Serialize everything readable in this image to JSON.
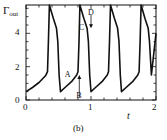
{
  "chart_data": {
    "type": "line",
    "title": "",
    "panel_label": "(b)",
    "xlabel": "t",
    "ylabel": "Γ_out",
    "ylabel_main": "Γ",
    "ylabel_sub": "out",
    "xlim": [
      0,
      2
    ],
    "ylim": [
      0,
      5.7
    ],
    "xticks": [
      0,
      1,
      2
    ],
    "yticks": [
      0,
      2,
      4
    ],
    "xtick_labels": [
      "0",
      "1",
      "2"
    ],
    "ytick_labels": [
      "0",
      "2",
      "4"
    ],
    "grid": false,
    "legend": null,
    "series": [
      {
        "name": "Γ_out(t)",
        "x": [
          0.0,
          0.1,
          0.2,
          0.3,
          0.33,
          0.345,
          0.36,
          0.42,
          0.47,
          0.49,
          0.51,
          0.53,
          0.6,
          0.7,
          0.78,
          0.8,
          0.815,
          0.83,
          0.89,
          0.94,
          0.96,
          0.98,
          1.0,
          1.07,
          1.17,
          1.25,
          1.27,
          1.285,
          1.3,
          1.36,
          1.41,
          1.43,
          1.45,
          1.47,
          1.54,
          1.64,
          1.72,
          1.74,
          1.755,
          1.77,
          1.83,
          1.88,
          1.9,
          1.93,
          2.0
        ],
        "y": [
          0.5,
          0.75,
          1.05,
          1.45,
          1.7,
          3.5,
          5.7,
          4.9,
          4.3,
          3.5,
          1.5,
          0.5,
          0.75,
          1.1,
          1.5,
          1.7,
          3.5,
          5.7,
          4.9,
          4.3,
          3.5,
          1.5,
          0.5,
          0.75,
          1.1,
          1.5,
          1.7,
          3.5,
          5.7,
          4.9,
          4.3,
          3.5,
          1.5,
          0.5,
          0.75,
          1.1,
          1.5,
          1.7,
          3.5,
          5.7,
          4.9,
          4.3,
          3.5,
          1.5,
          4.0
        ]
      }
    ],
    "annotations": [
      {
        "text": "A",
        "x": 0.78,
        "y": 1.5,
        "type": "label"
      },
      {
        "text": "B",
        "x": 0.82,
        "y": 1.5,
        "type": "arrow-up",
        "from_y": 0
      },
      {
        "text": "C",
        "x": 0.95,
        "y": 4.4,
        "type": "label"
      },
      {
        "text": "D",
        "x": 1.0,
        "y": 4.3,
        "type": "arrow-down",
        "from_y": 5.7
      }
    ]
  }
}
